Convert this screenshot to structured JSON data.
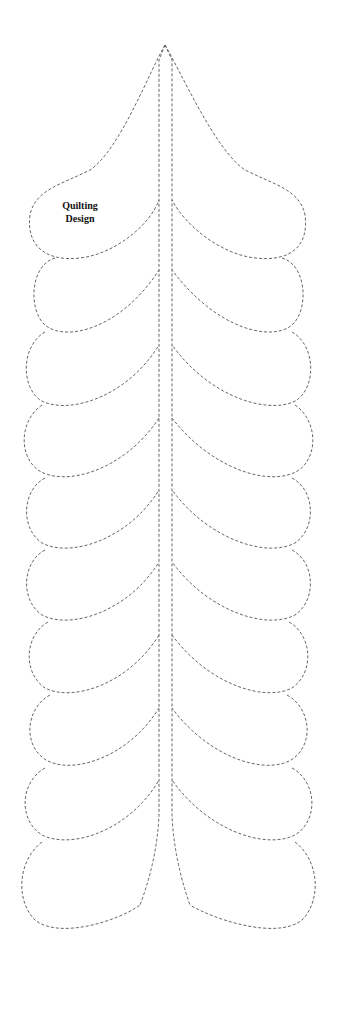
{
  "design": {
    "title_line1": "Quilting",
    "title_line2": "Design",
    "stroke_color": "#555555",
    "background": "#ffffff",
    "motif": "feather",
    "lobes_per_side": 10
  }
}
